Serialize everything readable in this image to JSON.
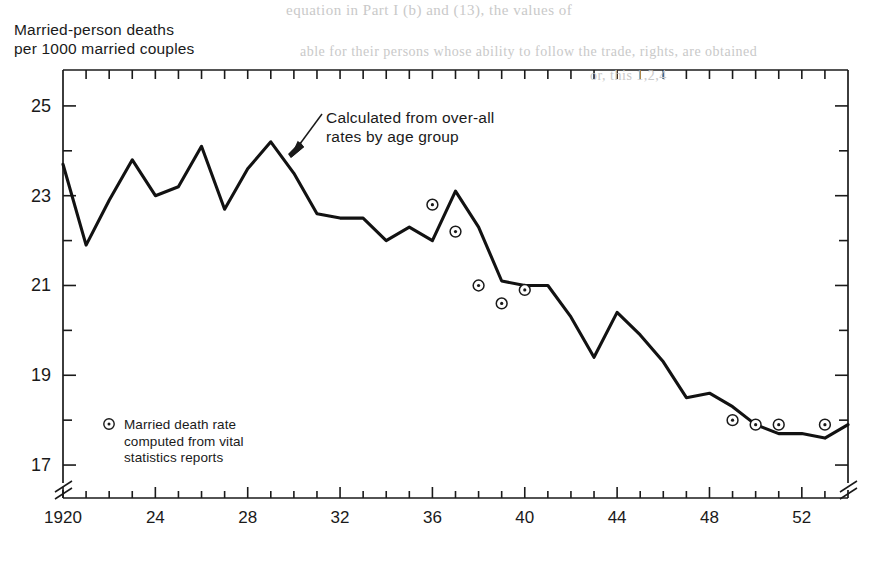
{
  "bleed_through": {
    "line1": "equation in Part I (b) and (13), the values of",
    "line2": "able for their persons whose ability to follow the trade, rights, are obtained",
    "line3": "or, this 1,2,4"
  },
  "axis_title": {
    "line1": "Married-person deaths",
    "line2": "per 1000 married couples"
  },
  "annotations": {
    "calculated": {
      "line1": "Calculated from over-all",
      "line2": "rates by age group"
    }
  },
  "legend": {
    "marker": "circle-dot-marker",
    "line1": "Married death rate",
    "line2": "computed from vital",
    "line3": "statistics reports"
  },
  "chart_data": {
    "type": "line",
    "title": "",
    "xlabel": "",
    "ylabel": "Married-person deaths per 1000 married couples",
    "xlim": [
      1920,
      1954
    ],
    "ylim": [
      16.6,
      25.8
    ],
    "xticks_major": [
      1920,
      1924,
      1928,
      1932,
      1936,
      1940,
      1944,
      1948,
      1952
    ],
    "xtick_labels": [
      "1920",
      "24",
      "28",
      "32",
      "36",
      "40",
      "44",
      "48",
      "52"
    ],
    "yticks_major": [
      17,
      19,
      21,
      23,
      25
    ],
    "ytick_labels": [
      "17",
      "19",
      "21",
      "23",
      "25"
    ],
    "ytick_minor": [
      18,
      20,
      22,
      24
    ],
    "grid": false,
    "axis_break_x": true,
    "axis_break_y": true,
    "series": [
      {
        "name": "Calculated from over-all rates by age group",
        "style": "line",
        "x": [
          1920,
          1921,
          1922,
          1923,
          1924,
          1925,
          1926,
          1927,
          1928,
          1929,
          1930,
          1931,
          1932,
          1933,
          1934,
          1935,
          1936,
          1937,
          1938,
          1939,
          1940,
          1941,
          1942,
          1943,
          1944,
          1945,
          1946,
          1947,
          1948,
          1949,
          1950,
          1951,
          1952,
          1953,
          1954
        ],
        "values": [
          23.7,
          21.9,
          22.9,
          23.8,
          23.0,
          23.2,
          24.1,
          22.7,
          23.6,
          24.2,
          23.5,
          22.6,
          22.5,
          22.5,
          22.0,
          22.3,
          22.0,
          23.1,
          22.3,
          21.1,
          21.0,
          21.0,
          20.3,
          19.4,
          20.4,
          19.9,
          19.3,
          18.5,
          18.6,
          18.3,
          17.9,
          17.7,
          17.7,
          17.6,
          17.9
        ]
      },
      {
        "name": "Married death rate computed from vital statistics reports",
        "style": "markers",
        "x": [
          1936,
          1937,
          1938,
          1939,
          1940,
          1949,
          1950,
          1951,
          1953
        ],
        "values": [
          22.8,
          22.2,
          21.0,
          20.6,
          20.9,
          18.0,
          17.9,
          17.9,
          17.9
        ]
      }
    ]
  }
}
